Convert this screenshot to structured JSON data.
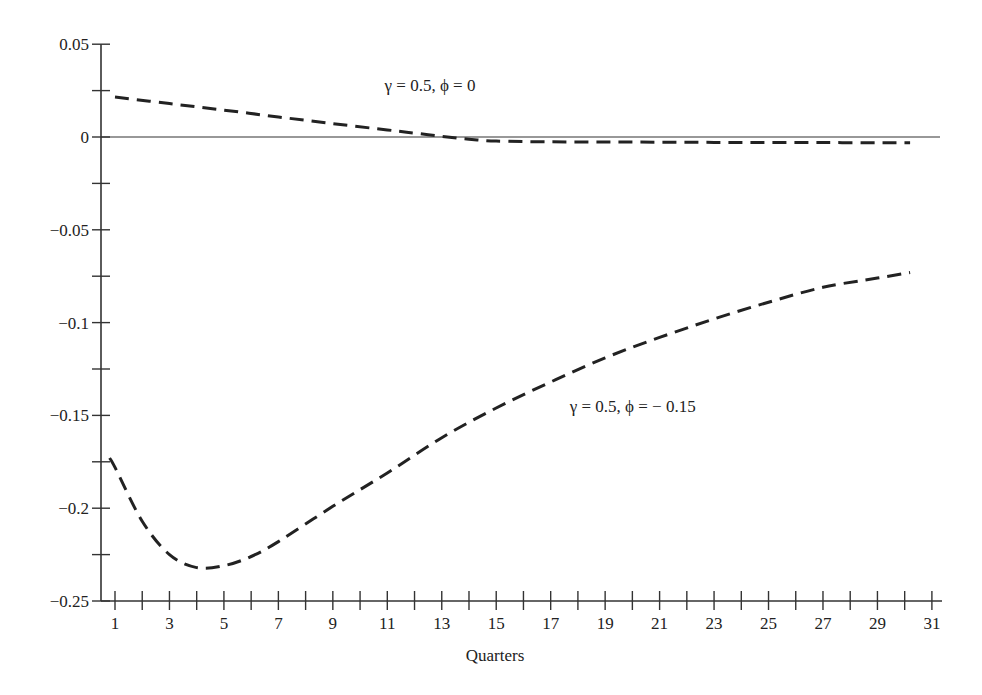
{
  "chart_data": {
    "type": "line",
    "title": "",
    "xlabel": "Quarters",
    "ylabel": "",
    "xlim": [
      0.5,
      31.5
    ],
    "ylim": [
      -0.25,
      0.05
    ],
    "grid": false,
    "legend": "none (inline curve annotations)",
    "x_ticks": [
      1,
      3,
      5,
      7,
      9,
      11,
      13,
      15,
      17,
      19,
      21,
      23,
      25,
      27,
      29,
      31
    ],
    "x_minor_ticks": [
      2,
      4,
      6,
      8,
      10,
      12,
      14,
      16,
      18,
      20,
      22,
      24,
      26,
      28,
      30
    ],
    "y_ticks": [
      {
        "value": 0.05,
        "label": "0.05"
      },
      {
        "value": 0.025,
        "label": ""
      },
      {
        "value": 0,
        "label": "0"
      },
      {
        "value": -0.025,
        "label": ""
      },
      {
        "value": -0.05,
        "label": "−0.05"
      },
      {
        "value": -0.075,
        "label": ""
      },
      {
        "value": -0.1,
        "label": "−0.1"
      },
      {
        "value": -0.125,
        "label": ""
      },
      {
        "value": -0.15,
        "label": "−0.15"
      },
      {
        "value": -0.175,
        "label": ""
      },
      {
        "value": -0.2,
        "label": "−0.2"
      },
      {
        "value": -0.225,
        "label": ""
      },
      {
        "value": -0.25,
        "label": "−0.25"
      }
    ],
    "zero_line": true,
    "series": [
      {
        "name": "γ = 0.5, ϕ = 0",
        "style": "dashed",
        "x": [
          1,
          3,
          5,
          7,
          9,
          11,
          12,
          13,
          14,
          15,
          17,
          19,
          21,
          23,
          25,
          27,
          29,
          30.2
        ],
        "values": [
          0.0215,
          0.018,
          0.0145,
          0.0108,
          0.0072,
          0.0038,
          0.0021,
          0.0004,
          -0.0012,
          -0.0022,
          -0.0026,
          -0.0027,
          -0.0028,
          -0.0029,
          -0.003,
          -0.003,
          -0.0031,
          -0.0031
        ]
      },
      {
        "name": "γ = 0.5, ϕ = − 0.15",
        "style": "dashed",
        "x": [
          0.8,
          1,
          2,
          3,
          4,
          5,
          6,
          7,
          9,
          11,
          13,
          15,
          17,
          19,
          21,
          23,
          25,
          27,
          29,
          30.2
        ],
        "values": [
          -0.173,
          -0.178,
          -0.207,
          -0.225,
          -0.232,
          -0.231,
          -0.226,
          -0.218,
          -0.199,
          -0.181,
          -0.162,
          -0.146,
          -0.132,
          -0.119,
          -0.108,
          -0.098,
          -0.089,
          -0.081,
          -0.076,
          -0.073
        ]
      }
    ],
    "annotations": [
      {
        "text": "γ = 0.5, ϕ = 0",
        "x": 10.9,
        "y": 0.025,
        "series": 0
      },
      {
        "text": "γ = 0.5, ϕ = − 0.15",
        "x": 17.7,
        "y": -0.148,
        "series": 1
      }
    ]
  }
}
